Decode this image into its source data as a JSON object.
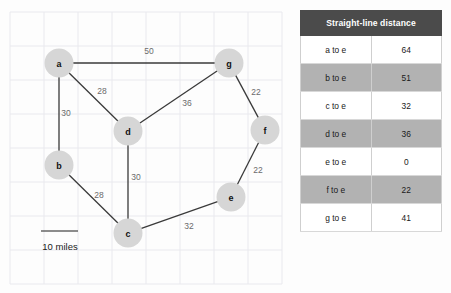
{
  "graph": {
    "scale_bar": {
      "label": "10 miles",
      "x1": 41,
      "x2": 78,
      "y": 231,
      "text_x": 60,
      "text_y": 246
    },
    "grid": {
      "vertical_x": [
        10,
        44,
        78,
        112,
        146,
        180,
        214,
        248,
        282
      ],
      "horizontal_y": [
        12,
        46,
        80,
        114,
        148,
        182,
        216,
        250,
        284
      ],
      "color": "#e9e9ee"
    },
    "node_radius": 14.5,
    "node_fill": "#d6d6d6",
    "edge_color": "#3a3a3a",
    "nodes": [
      {
        "id": "a",
        "label": "a",
        "x": 59,
        "y": 63
      },
      {
        "id": "b",
        "label": "b",
        "x": 59,
        "y": 165
      },
      {
        "id": "c",
        "label": "c",
        "x": 128,
        "y": 233
      },
      {
        "id": "d",
        "label": "d",
        "x": 128,
        "y": 131
      },
      {
        "id": "e",
        "label": "e",
        "x": 231,
        "y": 197
      },
      {
        "id": "f",
        "label": "f",
        "x": 265,
        "y": 130
      },
      {
        "id": "g",
        "label": "g",
        "x": 229,
        "y": 63
      }
    ],
    "edges": [
      {
        "from": "a",
        "to": "g",
        "weight": "50",
        "label_x": 149,
        "label_y": 51
      },
      {
        "from": "a",
        "to": "d",
        "weight": "28",
        "label_x": 102,
        "label_y": 91
      },
      {
        "from": "a",
        "to": "b",
        "weight": "30",
        "label_x": 66,
        "label_y": 113
      },
      {
        "from": "g",
        "to": "d",
        "weight": "36",
        "label_x": 187,
        "label_y": 103
      },
      {
        "from": "g",
        "to": "f",
        "weight": "22",
        "label_x": 256,
        "label_y": 92
      },
      {
        "from": "f",
        "to": "e",
        "weight": "22",
        "label_x": 258,
        "label_y": 170
      },
      {
        "from": "d",
        "to": "c",
        "weight": "30",
        "label_x": 136,
        "label_y": 177
      },
      {
        "from": "b",
        "to": "c",
        "weight": "28",
        "label_x": 99,
        "label_y": 195
      },
      {
        "from": "c",
        "to": "e",
        "weight": "32",
        "label_x": 189,
        "label_y": 226
      }
    ]
  },
  "table": {
    "header": "Straight-line distance",
    "header_bg": "#4b4b4b",
    "row_dark_bg": "#b2b2b2",
    "row_light_bg": "#ffffff",
    "rows": [
      {
        "pair": "a to e",
        "distance": "64",
        "shade": "light"
      },
      {
        "pair": "b to e",
        "distance": "51",
        "shade": "dark"
      },
      {
        "pair": "c to e",
        "distance": "32",
        "shade": "light"
      },
      {
        "pair": "d to e",
        "distance": "36",
        "shade": "dark"
      },
      {
        "pair": "e to e",
        "distance": "0",
        "shade": "light"
      },
      {
        "pair": "f to e",
        "distance": "22",
        "shade": "dark"
      },
      {
        "pair": "g to e",
        "distance": "41",
        "shade": "light"
      }
    ]
  }
}
